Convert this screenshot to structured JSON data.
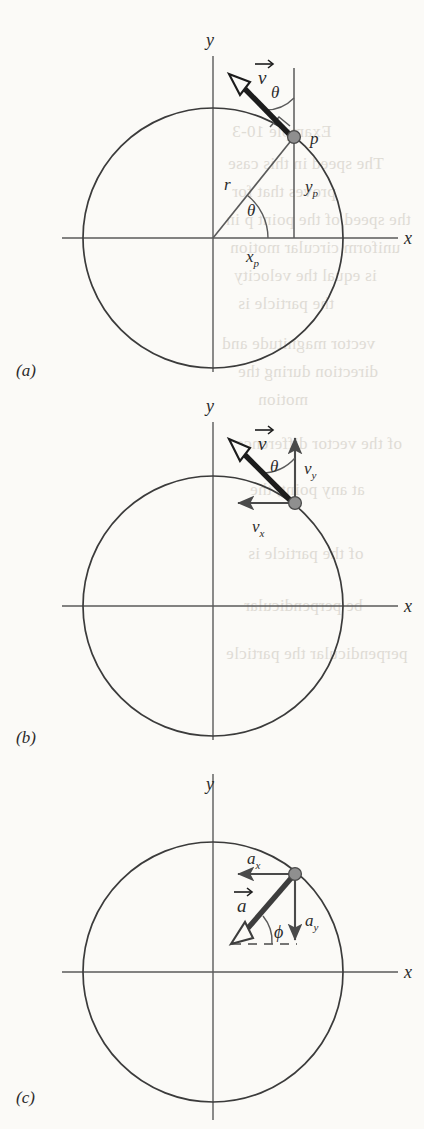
{
  "figure": {
    "type": "physics-diagram",
    "background_color": "#fbfaf7",
    "ink_color": "#2b2b2b",
    "dot_color": "#808080",
    "panels": [
      {
        "id": "a",
        "label": "(a)",
        "axis_labels": {
          "x": "x",
          "y": "y"
        },
        "vectors": [
          {
            "name": "velocity",
            "label": "v",
            "accent": "arrow",
            "style": "thick-hollow-head"
          }
        ],
        "segments": [
          {
            "name": "radius",
            "label": "r"
          },
          {
            "name": "y-component",
            "label": "y",
            "subscript": "p"
          },
          {
            "name": "x-component",
            "label": "x",
            "subscript": "p"
          }
        ],
        "angles": [
          {
            "name": "theta-at-origin",
            "label": "θ"
          },
          {
            "name": "theta-at-point",
            "label": "θ"
          }
        ],
        "points": [
          {
            "name": "point-p",
            "label": "p"
          }
        ],
        "markers": [
          {
            "name": "right-angle-marker"
          }
        ]
      },
      {
        "id": "b",
        "label": "(b)",
        "axis_labels": {
          "x": "x",
          "y": "y"
        },
        "vectors": [
          {
            "name": "velocity",
            "label": "v",
            "accent": "arrow",
            "style": "thick-hollow-head"
          },
          {
            "name": "velocity-x-component",
            "label": "v",
            "subscript": "x",
            "style": "thin-solid-head"
          },
          {
            "name": "velocity-y-component",
            "label": "v",
            "subscript": "y",
            "style": "thin-solid-head"
          }
        ],
        "angles": [
          {
            "name": "theta-at-point",
            "label": "θ"
          }
        ],
        "points": [
          {
            "name": "point-p"
          }
        ]
      },
      {
        "id": "c",
        "label": "(c)",
        "axis_labels": {
          "x": "x",
          "y": "y"
        },
        "vectors": [
          {
            "name": "acceleration",
            "label": "a",
            "accent": "arrow",
            "style": "thick-hollow-head"
          },
          {
            "name": "acceleration-x-component",
            "label": "a",
            "subscript": "x",
            "style": "thin-solid-head"
          },
          {
            "name": "acceleration-y-component",
            "label": "a",
            "subscript": "y",
            "style": "thin-solid-head"
          }
        ],
        "angles": [
          {
            "name": "phi-at-vector",
            "label": "ϕ"
          }
        ],
        "points": [
          {
            "name": "point-p"
          }
        ],
        "segments": [
          {
            "name": "dashed-reference-line",
            "style": "dashed"
          }
        ]
      }
    ]
  },
  "labels": {
    "axis_x": "x",
    "axis_y": "y",
    "point_p": "p",
    "radius": "r",
    "theta": "θ",
    "phi": "ϕ",
    "v": "v",
    "a": "a",
    "sub_x": "x",
    "sub_y": "y",
    "sub_p": "p",
    "panel_a": "(a)",
    "panel_b": "(b)",
    "panel_c": "(c)"
  },
  "bleedthrough": {
    "note": "faint mirrored text showing through from the reverse side of the page",
    "lines": [
      "Example 10-3",
      "The speed in this case",
      "proves that for",
      "the speed of the point p in",
      "uniform circular motion",
      "is equal the velocity",
      "the particle is",
      "vector magnitude and",
      "direction during the",
      "motion",
      "of the vector difference",
      "at any point, the",
      "of the particle is",
      "be perpendicular",
      "perpendicular the particle"
    ]
  }
}
